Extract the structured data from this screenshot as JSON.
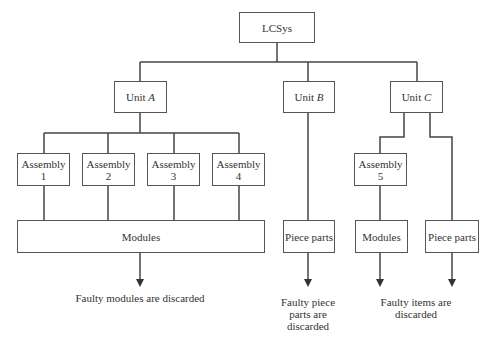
{
  "diagram": {
    "root": {
      "label": "LCSys"
    },
    "units": [
      {
        "prefix": "Unit ",
        "letter": "A"
      },
      {
        "prefix": "Unit ",
        "letter": "B"
      },
      {
        "prefix": "Unit ",
        "letter": "C"
      }
    ],
    "assemblies": [
      {
        "line1": "Assembly",
        "line2": "1"
      },
      {
        "line1": "Assembly",
        "line2": "2"
      },
      {
        "line1": "Assembly",
        "line2": "3"
      },
      {
        "line1": "Assembly",
        "line2": "4"
      },
      {
        "line1": "Assembly",
        "line2": "5"
      }
    ],
    "leaves": {
      "unit_a_modules": "Modules",
      "unit_b_piece_parts": "Piece parts",
      "unit_c_modules": "Modules",
      "unit_c_piece_parts": "Piece parts"
    },
    "captions": {
      "unit_a": "Faulty modules are discarded",
      "unit_b": [
        "Faulty piece",
        "parts are",
        "discarded"
      ],
      "unit_c": [
        "Faulty items are",
        "discarded"
      ]
    },
    "colors": {
      "line": "#444444",
      "box_border": "#555555",
      "text": "#333333"
    }
  }
}
